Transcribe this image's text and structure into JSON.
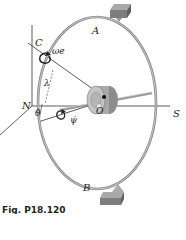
{
  "figure": {
    "caption": "Fig. P18.120",
    "labels": {
      "A": "A",
      "B": "B",
      "C": "C",
      "N": "N",
      "O": "O",
      "S": "S",
      "omega_e": "ωe",
      "lambda": "λ",
      "theta": "θ",
      "psi": "ψ̇"
    },
    "colors": {
      "ring": "#8a8a8a",
      "ring_highlight": "#d6d6d6",
      "block": "#7d7d7d",
      "block_top": "#a9a9a9",
      "rotor": "#b0b0b0",
      "lines": "#333333",
      "background": "#ffffff"
    }
  }
}
